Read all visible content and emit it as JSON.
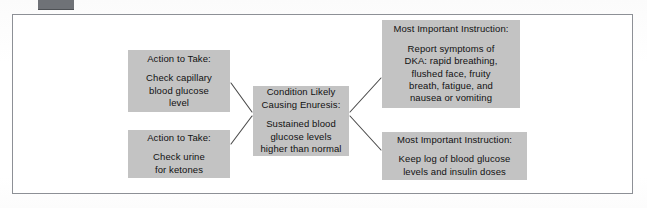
{
  "figure": {
    "top_bar_label": "toolbar-stub"
  },
  "nodes": {
    "action_glucose": {
      "header": "Action to Take:",
      "body": "Check capillary\nblood glucose\nlevel"
    },
    "action_ketones": {
      "header": "Action to Take:",
      "body": "Check urine\nfor ketones"
    },
    "condition": {
      "header": "Condition Likely\nCausing Enuresis:",
      "body": "Sustained blood\nglucose levels\nhigher than normal"
    },
    "instruction_dka": {
      "header": "Most Important Instruction:",
      "body": "Report symptoms of\nDKA: rapid breathing,\nflushed face, fruity\nbreath, fatigue, and\nnausea or vomiting"
    },
    "instruction_log": {
      "header": "Most Important Instruction:",
      "body": "Keep log of blood glucose\nlevels and insulin doses"
    }
  },
  "colors": {
    "node_fill": "#c3c3c3",
    "node_text": "#111111",
    "frame_border": "#8d9096",
    "connector_line": "#4a4a4a",
    "page_background": "#ffffff",
    "top_bar": "#6f7277"
  },
  "connectors": [
    {
      "name": "glucose-to-condition",
      "from": "action_glucose",
      "to": "condition"
    },
    {
      "name": "ketones-to-condition",
      "from": "action_ketones",
      "to": "condition"
    },
    {
      "name": "condition-to-dka",
      "from": "condition",
      "to": "instruction_dka"
    },
    {
      "name": "condition-to-log",
      "from": "condition",
      "to": "instruction_log"
    }
  ]
}
